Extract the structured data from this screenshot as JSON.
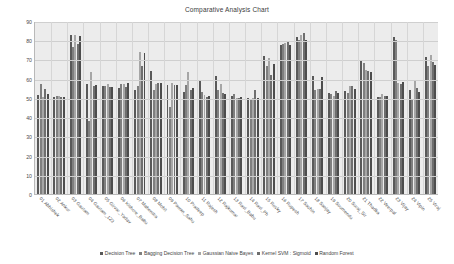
{
  "chart_data": {
    "type": "bar",
    "title": "Comparative Analysis Chart",
    "xlabel": "",
    "ylabel": "",
    "ylim": [
      0,
      90
    ],
    "yticks": [
      0,
      10,
      20,
      30,
      40,
      50,
      60,
      70,
      80,
      90
    ],
    "grid": true,
    "legend_position": "bottom",
    "categories": [
      "01 Abhishek",
      "02 Ankur",
      "03 Gautam",
      "04 Gautam_123",
      "05 Girvar_Yadav",
      "06 Kishore_Babu",
      "07 Mahendra",
      "08 Mohit",
      "09 Pawan_Sahu",
      "10 Pradeep",
      "11 Rajesh",
      "12 Rajkumar",
      "13 Ravi_Babu",
      "14 Ravi_Ph",
      "15 Rocky",
      "16 Rupesh",
      "17 Sachin",
      "18 Sanjay",
      "19 Soumendu",
      "20 Suraj_Sir",
      "21 Thadka",
      "22 Veerpal",
      "23 Vijay",
      "24 Vipin",
      "25 Viraj"
    ],
    "series": [
      {
        "name": "Decision Tree",
        "color": "#595959",
        "values": [
          52.0,
          51.0,
          83.0,
          57.5,
          56.5,
          55.5,
          54.5,
          64.5,
          57.0,
          53.5,
          59.5,
          61.5,
          51.5,
          50.0,
          72.0,
          78.0,
          82.0,
          61.5,
          53.0,
          54.0,
          70.0,
          51.0,
          82.0,
          54.5,
          71.5
        ]
      },
      {
        "name": "Bagging Decision Tree",
        "color": "#7f7f7f",
        "values": [
          57.5,
          51.5,
          77.0,
          38.0,
          56.5,
          57.5,
          56.5,
          54.5,
          45.5,
          57.0,
          53.5,
          54.5,
          52.5,
          49.5,
          67.0,
          78.5,
          80.5,
          54.5,
          52.5,
          53.0,
          68.5,
          51.0,
          80.5,
          49.0,
          67.0
        ]
      },
      {
        "name": "Gaussian Naive Bayes",
        "color": "#a6a6a6",
        "values": [
          51.0,
          51.5,
          83.0,
          64.0,
          57.5,
          57.5,
          74.5,
          57.5,
          58.0,
          64.0,
          52.0,
          57.5,
          50.5,
          50.0,
          71.0,
          79.0,
          83.0,
          55.0,
          51.5,
          56.5,
          65.0,
          52.5,
          58.0,
          59.5,
          72.5
        ]
      },
      {
        "name": "Kernel SVM : Sigmoid",
        "color": "#6e6e6e",
        "values": [
          55.0,
          51.0,
          78.5,
          56.5,
          56.0,
          56.0,
          67.0,
          58.0,
          57.0,
          54.5,
          51.0,
          53.0,
          50.0,
          54.5,
          62.5,
          79.5,
          84.0,
          55.0,
          54.0,
          56.5,
          64.5,
          51.5,
          57.5,
          55.5,
          69.0
        ]
      },
      {
        "name": "Random Forest",
        "color": "#4d4d4d",
        "values": [
          52.5,
          51.0,
          82.5,
          57.0,
          56.0,
          58.0,
          74.0,
          58.0,
          57.0,
          55.5,
          51.5,
          52.5,
          51.0,
          50.0,
          68.0,
          78.0,
          80.5,
          61.0,
          53.0,
          55.0,
          64.0,
          51.5,
          58.5,
          53.5,
          67.5
        ]
      }
    ]
  }
}
